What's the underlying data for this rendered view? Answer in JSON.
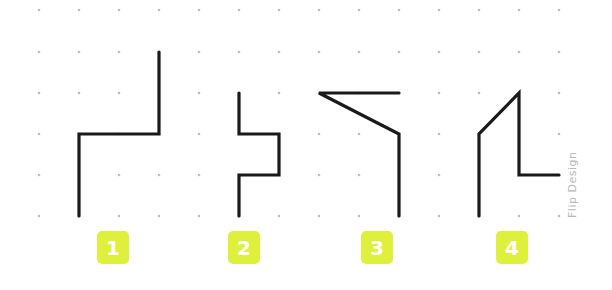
{
  "diagram": {
    "title": "",
    "grid": {
      "columns_x": [
        39,
        79,
        119,
        159,
        199,
        239,
        279,
        319,
        359,
        399,
        439,
        479,
        519,
        559
      ],
      "rows_y": [
        10,
        52,
        93,
        134,
        175,
        216
      ],
      "dot_color": "#bdbdbd",
      "missing_dots": [
        [
          159,
          52
        ],
        [
          159,
          93
        ],
        [
          159,
          134
        ],
        [
          79,
          134
        ],
        [
          79,
          175
        ],
        [
          79,
          216
        ],
        [
          239,
          93
        ],
        [
          239,
          134
        ],
        [
          279,
          134
        ],
        [
          279,
          175
        ],
        [
          239,
          175
        ],
        [
          239,
          216
        ],
        [
          199,
          134
        ],
        [
          319,
          93
        ],
        [
          359,
          93
        ],
        [
          399,
          93
        ],
        [
          399,
          134
        ],
        [
          399,
          175
        ],
        [
          399,
          216
        ],
        [
          479,
          134
        ],
        [
          479,
          175
        ],
        [
          479,
          216
        ],
        [
          519,
          93
        ],
        [
          519,
          134
        ],
        [
          519,
          175
        ],
        [
          559,
          175
        ],
        [
          439,
          93
        ],
        [
          279,
          93
        ],
        [
          119,
          134
        ],
        [
          199,
          52
        ],
        [
          319,
          52
        ]
      ]
    },
    "stroke_color": "#1a1a1a",
    "shapes": [
      {
        "id": 1,
        "points": [
          [
            159,
            52
          ],
          [
            159,
            134
          ],
          [
            79,
            134
          ],
          [
            79,
            216
          ]
        ]
      },
      {
        "id": 2,
        "points": [
          [
            239,
            93
          ],
          [
            239,
            134
          ],
          [
            279,
            134
          ],
          [
            279,
            175
          ],
          [
            239,
            175
          ],
          [
            239,
            216
          ]
        ]
      },
      {
        "id": 3,
        "points": [
          [
            399,
            93
          ],
          [
            319,
            93
          ],
          [
            399,
            134
          ],
          [
            399,
            216
          ]
        ]
      },
      {
        "id": 4,
        "points": [
          [
            479,
            216
          ],
          [
            479,
            134
          ],
          [
            519,
            93
          ],
          [
            519,
            175
          ],
          [
            559,
            175
          ]
        ]
      }
    ],
    "badges": [
      {
        "label": "1",
        "x": 97,
        "y": 231
      },
      {
        "label": "2",
        "x": 228,
        "y": 231
      },
      {
        "label": "3",
        "x": 361,
        "y": 231
      },
      {
        "label": "4",
        "x": 496,
        "y": 231
      }
    ],
    "badge_color": "#dff03c",
    "credit": "Flip Design"
  }
}
